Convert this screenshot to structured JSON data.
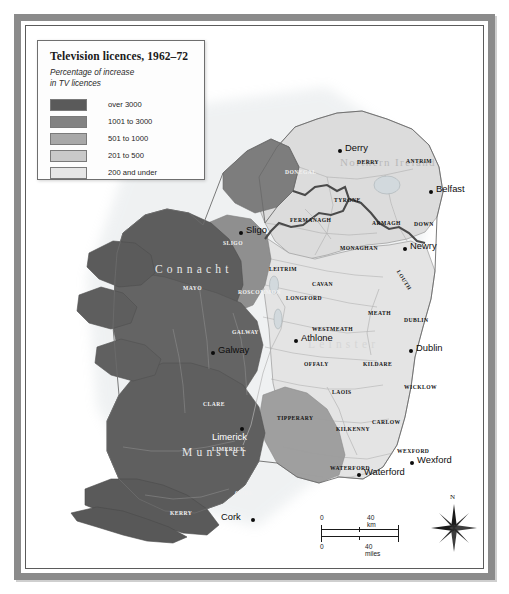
{
  "legend": {
    "title": "Television licences, 1962–72",
    "subtitle_line1": "Percentage of increase",
    "subtitle_line2": "in TV licences",
    "entries": [
      {
        "label": "over 3000",
        "color": "#5a5a5a"
      },
      {
        "label": "1001 to 3000",
        "color": "#828282"
      },
      {
        "label": "501 to 1000",
        "color": "#a8a8a8"
      },
      {
        "label": "201 to 500",
        "color": "#c9c9c9"
      },
      {
        "label": "200 and under",
        "color": "#e6e6e6"
      }
    ]
  },
  "provinces": [
    {
      "name": "Connacht",
      "x": 128,
      "y": 242
    },
    {
      "name": "Leinster",
      "x": 281,
      "y": 317
    },
    {
      "name": "Munster",
      "x": 155,
      "y": 425
    },
    {
      "name": "Northern Ireland",
      "x": 313,
      "y": 135
    }
  ],
  "counties": [
    {
      "name": "DONEGAL",
      "x": 258,
      "y": 142,
      "shade": "dark"
    },
    {
      "name": "DERRY",
      "x": 330,
      "y": 132,
      "shade": "light"
    },
    {
      "name": "ANTRIM",
      "x": 379,
      "y": 131,
      "shade": "light"
    },
    {
      "name": "TYRONE",
      "x": 307,
      "y": 170,
      "shade": "light"
    },
    {
      "name": "FERMANAGH",
      "x": 263,
      "y": 190,
      "shade": "light"
    },
    {
      "name": "ARMAGH",
      "x": 345,
      "y": 193,
      "shade": "light"
    },
    {
      "name": "DOWN",
      "x": 387,
      "y": 194,
      "shade": "light"
    },
    {
      "name": "MONAGHAN",
      "x": 313,
      "y": 218,
      "shade": "light"
    },
    {
      "name": "SLIGO",
      "x": 196,
      "y": 213,
      "shade": "dark"
    },
    {
      "name": "LEITRIM",
      "x": 242,
      "y": 239,
      "shade": "light"
    },
    {
      "name": "CAVAN",
      "x": 285,
      "y": 254,
      "shade": "light"
    },
    {
      "name": "LOUTH",
      "x": 366,
      "y": 250,
      "shade": "light"
    },
    {
      "name": "ROSCOMMON",
      "x": 211,
      "y": 262,
      "shade": "dark"
    },
    {
      "name": "LONGFORD",
      "x": 259,
      "y": 268,
      "shade": "light"
    },
    {
      "name": "MAYO",
      "x": 156,
      "y": 258,
      "shade": "dark"
    },
    {
      "name": "MEATH",
      "x": 341,
      "y": 283,
      "shade": "light"
    },
    {
      "name": "WESTMEATH",
      "x": 285,
      "y": 299,
      "shade": "light"
    },
    {
      "name": "DUBLIN",
      "x": 377,
      "y": 290,
      "shade": "light"
    },
    {
      "name": "GALWAY",
      "x": 205,
      "y": 302,
      "shade": "dark"
    },
    {
      "name": "OFFALY",
      "x": 277,
      "y": 334,
      "shade": "light"
    },
    {
      "name": "KILDARE",
      "x": 336,
      "y": 334,
      "shade": "light"
    },
    {
      "name": "LAOIS",
      "x": 305,
      "y": 362,
      "shade": "light"
    },
    {
      "name": "WICKLOW",
      "x": 377,
      "y": 357,
      "shade": "light"
    },
    {
      "name": "CLARE",
      "x": 176,
      "y": 374,
      "shade": "dark"
    },
    {
      "name": "TIPPERARY",
      "x": 250,
      "y": 388,
      "shade": "light"
    },
    {
      "name": "CARLOW",
      "x": 345,
      "y": 392,
      "shade": "light"
    },
    {
      "name": "KILKENNY",
      "x": 309,
      "y": 399,
      "shade": "light"
    },
    {
      "name": "LIMERICK",
      "x": 185,
      "y": 419,
      "shade": "dark"
    },
    {
      "name": "WEXFORD",
      "x": 370,
      "y": 421,
      "shade": "light"
    },
    {
      "name": "WATERFORD",
      "x": 303,
      "y": 438,
      "shade": "light"
    },
    {
      "name": "CORK",
      "x": 208,
      "y": 463,
      "shade": "dark"
    },
    {
      "name": "KERRY",
      "x": 143,
      "y": 483,
      "shade": "dark"
    }
  ],
  "cities": [
    {
      "name": "Derry",
      "dot_x": 311,
      "dot_y": 122,
      "label_x": 318,
      "label_y": 115,
      "shade": "light"
    },
    {
      "name": "Belfast",
      "dot_x": 402,
      "dot_y": 163,
      "label_x": 409,
      "label_y": 156,
      "shade": "light"
    },
    {
      "name": "Sligo",
      "dot_x": 212,
      "dot_y": 204,
      "label_x": 219,
      "label_y": 197,
      "shade": "light"
    },
    {
      "name": "Newry",
      "dot_x": 376,
      "dot_y": 220,
      "label_x": 383,
      "label_y": 213,
      "shade": "light"
    },
    {
      "name": "Athlone",
      "dot_x": 267,
      "dot_y": 312,
      "label_x": 274,
      "label_y": 305,
      "shade": "light"
    },
    {
      "name": "Dublin",
      "dot_x": 382,
      "dot_y": 322,
      "label_x": 389,
      "label_y": 315,
      "shade": "light"
    },
    {
      "name": "Galway",
      "dot_x": 184,
      "dot_y": 324,
      "label_x": 191,
      "label_y": 317,
      "shade": "light"
    },
    {
      "name": "Limerick",
      "dot_x": 213,
      "dot_y": 400,
      "label_x": 208,
      "label_y": 404,
      "shade": "light"
    },
    {
      "name": "Waterford",
      "dot_x": 330,
      "dot_y": 446,
      "label_x": 337,
      "label_y": 439,
      "shade": "light"
    },
    {
      "name": "Wexford",
      "dot_x": 383,
      "dot_y": 434,
      "label_x": 390,
      "label_y": 427,
      "shade": "light"
    },
    {
      "name": "Cork",
      "dot_x": 224,
      "dot_y": 491,
      "label_x": 194,
      "label_y": 484,
      "shade": "light"
    }
  ],
  "scalebar": {
    "km_zero": "0",
    "km_value": "40 km",
    "miles_zero": "0",
    "miles_value": "40 miles"
  },
  "compass": {
    "north_label": "N"
  }
}
